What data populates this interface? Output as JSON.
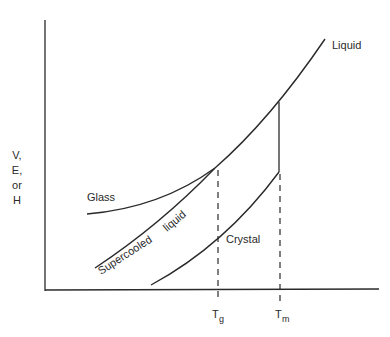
{
  "diagram": {
    "y_axis_label_lines": [
      "V,",
      "E,",
      "or",
      "H"
    ],
    "x_ticks": {
      "tg": {
        "main": "T",
        "sub": "g"
      },
      "tm": {
        "main": "T",
        "sub": "m"
      }
    },
    "curve_labels": {
      "liquid": "Liquid",
      "glass": "Glass",
      "supercooled_word": "Supercooled",
      "liquid_word": "liquid",
      "crystal": "Crystal"
    },
    "colors": {
      "line": "#2a2a2a",
      "background": "#ffffff"
    }
  }
}
